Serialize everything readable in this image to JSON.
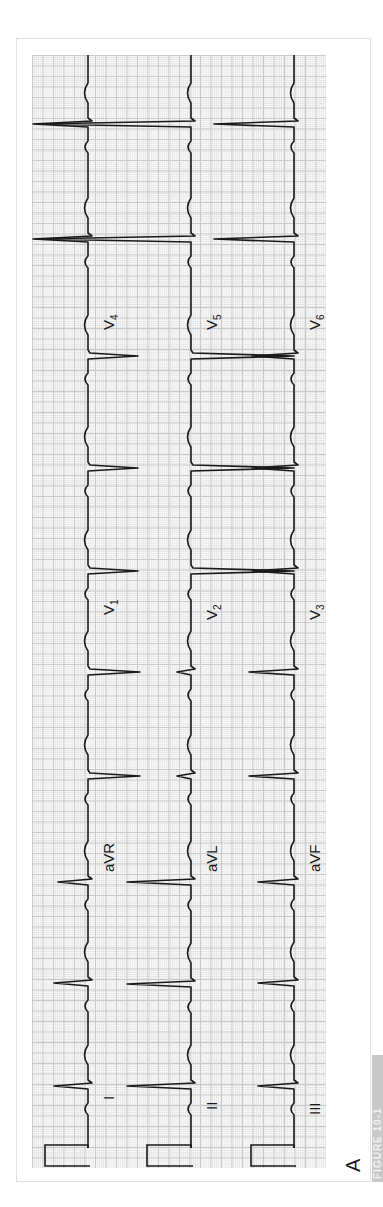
{
  "figure": {
    "panel_letter": "A",
    "side_caption": "FIGURE 10-1",
    "orientation": "rotated 90° counter-clockwise (time runs bottom-to-top)"
  },
  "colors": {
    "trace": "#1a1a1a",
    "grid_major": "#c9c9c9",
    "grid_minor": "#e6e6e6",
    "paper": "#fbfbfb",
    "caption_strip": "#c8c8c8"
  },
  "rows": [
    {
      "name": "row-1",
      "baseline_x": 88,
      "segments": [
        {
          "lead": "I",
          "label": "I",
          "sub": "",
          "label_y": 1100
        },
        {
          "lead": "aVR",
          "label": "aVR",
          "sub": "",
          "label_y": 872
        },
        {
          "lead": "V1",
          "label": "V",
          "sub": "1",
          "label_y": 615
        },
        {
          "lead": "V4",
          "label": "V",
          "sub": "4",
          "label_y": 330
        }
      ]
    },
    {
      "name": "row-2",
      "baseline_x": 191,
      "segments": [
        {
          "lead": "II",
          "label": "II",
          "sub": "",
          "label_y": 1110
        },
        {
          "lead": "aVL",
          "label": "aVL",
          "sub": "",
          "label_y": 872
        },
        {
          "lead": "V2",
          "label": "V",
          "sub": "2",
          "label_y": 620
        },
        {
          "lead": "V5",
          "label": "V",
          "sub": "5",
          "label_y": 330
        }
      ]
    },
    {
      "name": "row-3",
      "baseline_x": 294,
      "segments": [
        {
          "lead": "III",
          "label": "III",
          "sub": "",
          "label_y": 1115
        },
        {
          "lead": "aVF",
          "label": "aVF",
          "sub": "",
          "label_y": 872
        },
        {
          "lead": "V3",
          "label": "V",
          "sub": "3",
          "label_y": 620
        },
        {
          "lead": "V6",
          "label": "V",
          "sub": "6",
          "label_y": 330
        }
      ]
    }
  ],
  "beats": [
    {
      "row": 0,
      "y": 1085,
      "amp": 34
    },
    {
      "row": 0,
      "y": 982,
      "amp": 34
    },
    {
      "row": 0,
      "y": 881,
      "amp": 30
    },
    {
      "row": 0,
      "y": 775,
      "amp": -52
    },
    {
      "row": 0,
      "y": 671,
      "amp": -52
    },
    {
      "row": 0,
      "y": 570,
      "amp": -50
    },
    {
      "row": 0,
      "y": 467,
      "amp": -50
    },
    {
      "row": 0,
      "y": 355,
      "amp": -50
    },
    {
      "row": 0,
      "y": 238,
      "amp": 55
    },
    {
      "row": 0,
      "y": 123,
      "amp": 55
    },
    {
      "row": 1,
      "y": 1085,
      "amp": 64
    },
    {
      "row": 1,
      "y": 983,
      "amp": 64
    },
    {
      "row": 1,
      "y": 881,
      "amp": 64
    },
    {
      "row": 1,
      "y": 775,
      "amp": 14
    },
    {
      "row": 1,
      "y": 671,
      "amp": 14
    },
    {
      "row": 1,
      "y": 570,
      "amp": -103
    },
    {
      "row": 1,
      "y": 467,
      "amp": -103
    },
    {
      "row": 1,
      "y": 355,
      "amp": -103
    },
    {
      "row": 1,
      "y": 238,
      "amp": 155
    },
    {
      "row": 1,
      "y": 123,
      "amp": 155
    },
    {
      "row": 2,
      "y": 1085,
      "amp": 36
    },
    {
      "row": 2,
      "y": 982,
      "amp": 36
    },
    {
      "row": 2,
      "y": 881,
      "amp": 36
    },
    {
      "row": 2,
      "y": 775,
      "amp": 45
    },
    {
      "row": 2,
      "y": 671,
      "amp": 45
    },
    {
      "row": 2,
      "y": 570,
      "amp": 42
    },
    {
      "row": 2,
      "y": 467,
      "amp": 42
    },
    {
      "row": 2,
      "y": 355,
      "amp": 42
    },
    {
      "row": 2,
      "y": 238,
      "amp": 80
    },
    {
      "row": 2,
      "y": 123,
      "amp": 80
    }
  ],
  "calibration": [
    {
      "row": 0,
      "x_left": 45,
      "y_top": 1145,
      "y_bottom": 1166
    },
    {
      "row": 1,
      "x_left": 147,
      "y_top": 1145,
      "y_bottom": 1166
    },
    {
      "row": 2,
      "x_left": 251,
      "y_top": 1145,
      "y_bottom": 1166
    }
  ]
}
